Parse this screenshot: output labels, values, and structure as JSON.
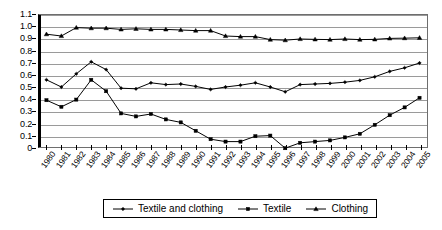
{
  "chart_data": {
    "type": "line",
    "title": "",
    "subtitle": "",
    "xlabel": "",
    "ylabel": "",
    "grid": true,
    "legend_position": "bottom",
    "xlim": [
      1980,
      2005
    ],
    "ylim": [
      0,
      1.1
    ],
    "y_ticks": [
      "0",
      "0.1",
      "0.2",
      "0.3",
      "0.4",
      "0.5",
      "0.6",
      "0.7",
      "0.8",
      "0.9",
      "1.0",
      "1.1"
    ],
    "y_tick_values": [
      0,
      0.1,
      0.2,
      0.3,
      0.4,
      0.5,
      0.6,
      0.7,
      0.8,
      0.9,
      1.0,
      1.1
    ],
    "categories": [
      "1980",
      "1981",
      "1982",
      "1983",
      "1984",
      "1985",
      "1986",
      "1987",
      "1988",
      "1989",
      "1990",
      "1991",
      "1992",
      "1993",
      "1994",
      "1995",
      "1996",
      "1997",
      "1998",
      "1999",
      "2000",
      "2001",
      "2002",
      "2003",
      "2004",
      "2005"
    ],
    "x": [
      1980,
      1981,
      1982,
      1983,
      1984,
      1985,
      1986,
      1987,
      1988,
      1989,
      1990,
      1991,
      1992,
      1993,
      1994,
      1995,
      1996,
      1997,
      1998,
      1999,
      2000,
      2001,
      2002,
      2003,
      2004,
      2005
    ],
    "series": [
      {
        "name": "Textile and clothing",
        "marker": "diamond",
        "values": [
          0.56,
          0.5,
          0.61,
          0.71,
          0.645,
          0.49,
          0.485,
          0.535,
          0.52,
          0.525,
          0.505,
          0.48,
          0.5,
          0.515,
          0.535,
          0.5,
          0.46,
          0.52,
          0.525,
          0.53,
          0.54,
          0.555,
          0.585,
          0.63,
          0.66,
          0.7
        ]
      },
      {
        "name": "Textile",
        "marker": "square",
        "values": [
          0.39,
          0.335,
          0.395,
          0.56,
          0.465,
          0.28,
          0.255,
          0.275,
          0.23,
          0.205,
          0.135,
          0.065,
          0.045,
          0.045,
          0.09,
          0.095,
          -0.01,
          0.035,
          0.045,
          0.055,
          0.08,
          0.11,
          0.185,
          0.265,
          0.33,
          0.41
        ]
      },
      {
        "name": "Clothing",
        "marker": "triangle",
        "values": [
          0.94,
          0.925,
          0.995,
          0.99,
          0.99,
          0.98,
          0.985,
          0.98,
          0.98,
          0.975,
          0.97,
          0.97,
          0.925,
          0.92,
          0.92,
          0.895,
          0.89,
          0.9,
          0.897,
          0.895,
          0.9,
          0.895,
          0.897,
          0.905,
          0.907,
          0.91
        ]
      }
    ]
  },
  "legend": {
    "items": [
      {
        "label": "Textile and clothing",
        "marker": "diamond-marker-icon"
      },
      {
        "label": "Textile",
        "marker": "square-marker-icon"
      },
      {
        "label": "Clothing",
        "marker": "triangle-marker-icon"
      }
    ]
  }
}
